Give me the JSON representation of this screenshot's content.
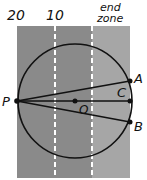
{
  "diagram": {
    "yard_labels": [
      {
        "text": "20",
        "x": 21,
        "y": 19
      },
      {
        "text": "10",
        "x": 57,
        "y": 19
      }
    ],
    "end_zone_label": {
      "line1": "end",
      "line2": "zone"
    },
    "points": {
      "P": {
        "label": "P",
        "x": 17,
        "y": 101
      },
      "A": {
        "label": "A",
        "x": 130,
        "y": 81
      },
      "B": {
        "label": "B",
        "x": 130,
        "y": 122
      },
      "C": {
        "label": "C",
        "x": 130,
        "y": 101
      },
      "O": {
        "label": "O",
        "x": 75,
        "y": 101
      }
    },
    "circle": {
      "cx": 75,
      "cy": 101,
      "r": 57
    },
    "colors": {
      "field": "#8a8a8a",
      "end_zone": "#a6a6a6",
      "yard_line": "#ffffff",
      "ink": "#111111"
    }
  }
}
